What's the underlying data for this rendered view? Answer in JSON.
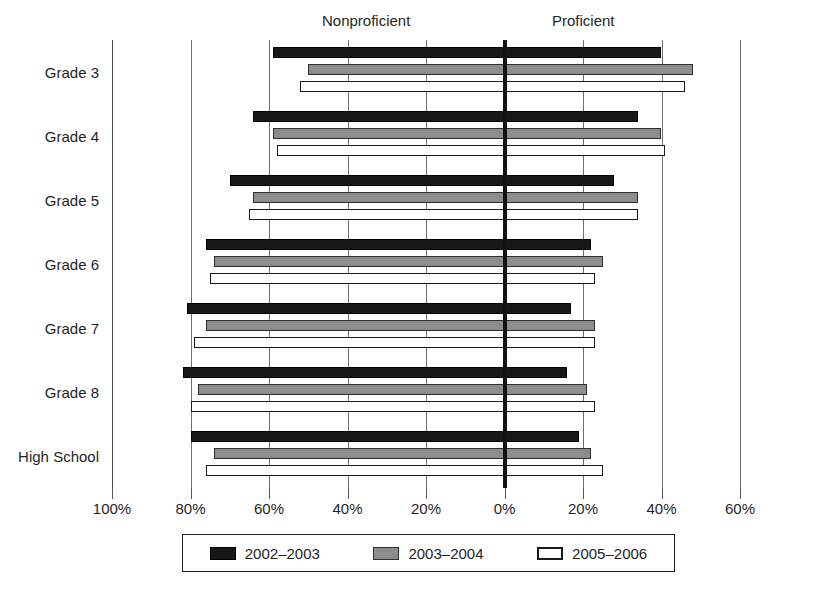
{
  "chart_data": {
    "type": "bar",
    "orientation": "horizontal",
    "layout": "diverging",
    "title": "",
    "xlabel": "",
    "ylabel": "",
    "left_region_label": "Nonproficient",
    "right_region_label": "Proficient",
    "categories": [
      "Grade 3",
      "Grade 4",
      "Grade 5",
      "Grade 6",
      "Grade 7",
      "Grade 8",
      "High School"
    ],
    "axis": {
      "ticks": [
        -100,
        -80,
        -60,
        -40,
        -20,
        0,
        20,
        40,
        60
      ],
      "tick_labels": [
        "100%",
        "80%",
        "60%",
        "40%",
        "20%",
        "0%",
        "20%",
        "40%",
        "60%"
      ],
      "xlim": [
        -100,
        60
      ],
      "grid": true,
      "zero_line": true
    },
    "series": [
      {
        "name": "2002–2003",
        "color": "#171717",
        "nonproficient": [
          59,
          64,
          70,
          76,
          81,
          82,
          80
        ],
        "proficient": [
          40,
          34,
          28,
          22,
          17,
          16,
          19
        ]
      },
      {
        "name": "2003–2004",
        "color": "#8d8d8d",
        "nonproficient": [
          50,
          59,
          64,
          74,
          76,
          78,
          74
        ],
        "proficient": [
          48,
          40,
          34,
          25,
          23,
          21,
          22
        ]
      },
      {
        "name": "2005–2006",
        "color": "#ffffff",
        "nonproficient": [
          52,
          58,
          65,
          75,
          79,
          80,
          76
        ],
        "proficient": [
          46,
          41,
          34,
          23,
          23,
          23,
          25
        ]
      }
    ],
    "legend": {
      "position": "bottom",
      "entries": [
        "2002–2003",
        "2003–2004",
        "2005–2006"
      ]
    }
  }
}
